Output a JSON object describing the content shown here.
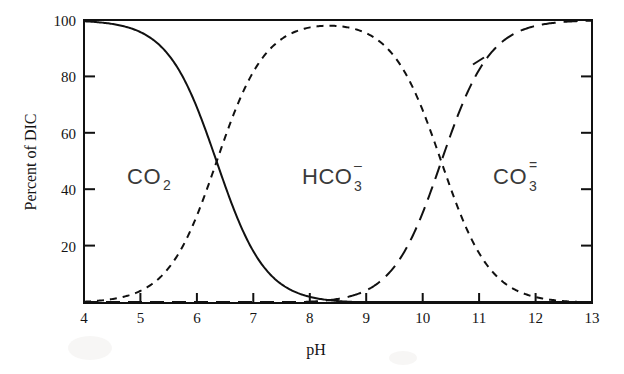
{
  "figure": {
    "background_color": "#ffffff",
    "ink_color": "#111111"
  },
  "axes": {
    "x_title": "pH",
    "y_title": "Percent of DIC",
    "x_ticks": [
      "4",
      "5",
      "6",
      "7",
      "8",
      "9",
      "10",
      "11",
      "12",
      "13"
    ],
    "y_ticks": [
      "20",
      "40",
      "60",
      "80",
      "100"
    ]
  },
  "series_labels": {
    "co2": {
      "formula": "CO",
      "sub": "2",
      "charge": ""
    },
    "hco3": {
      "formula": "HCO",
      "sub": "3",
      "charge": "–"
    },
    "co3": {
      "formula": "CO",
      "sub": "3",
      "charge": "="
    }
  },
  "chart_data": {
    "type": "line",
    "title": "",
    "xlabel": "pH",
    "ylabel": "Percent of DIC",
    "xlim": [
      4,
      13
    ],
    "ylim": [
      0,
      100
    ],
    "xticks": [
      4,
      5,
      6,
      7,
      8,
      9,
      10,
      11,
      12,
      13
    ],
    "yticks": [
      0,
      20,
      40,
      60,
      80,
      100
    ],
    "grid": false,
    "legend": "inline-annotations",
    "annotations": [
      {
        "text": "CO2",
        "display": "CO₂",
        "x": 5.25,
        "y": 50
      },
      {
        "text": "HCO3-",
        "display": "HCO₃⁻",
        "x": 8.35,
        "y": 50
      },
      {
        "text": "CO3=",
        "display": "CO₃⁼",
        "x": 11.55,
        "y": 50
      }
    ],
    "x": [
      4.0,
      4.5,
      5.0,
      5.5,
      6.0,
      6.35,
      6.5,
      7.0,
      7.5,
      8.0,
      8.3,
      8.5,
      9.0,
      9.5,
      10.0,
      10.33,
      10.5,
      11.0,
      11.5,
      12.0,
      12.5,
      13.0
    ],
    "series": [
      {
        "name": "CO2",
        "linestyle": "solid",
        "values": [
          99.6,
          98.6,
          95.7,
          87.6,
          69.1,
          50.0,
          41.4,
          18.2,
          6.6,
          2.2,
          1.1,
          0.7,
          0.2,
          0.07,
          0.02,
          0.008,
          0.006,
          0.0,
          0.0,
          0.0,
          0.0,
          0.0
        ]
      },
      {
        "name": "HCO3-",
        "linestyle": "short-dash",
        "values": [
          0.4,
          1.4,
          4.3,
          12.4,
          30.9,
          50.0,
          58.6,
          81.8,
          93.3,
          97.6,
          98.2,
          98.0,
          95.5,
          87.2,
          68.2,
          50.0,
          40.2,
          17.5,
          6.3,
          2.1,
          0.7,
          0.2
        ]
      },
      {
        "name": "CO3=",
        "linestyle": "long-dash",
        "values": [
          0.0,
          0.0,
          0.0,
          0.0,
          0.0,
          0.0,
          0.0,
          0.0,
          0.1,
          0.2,
          0.7,
          1.3,
          4.3,
          12.5,
          31.8,
          50.0,
          59.8,
          82.5,
          93.7,
          97.9,
          99.3,
          99.8
        ]
      }
    ]
  }
}
